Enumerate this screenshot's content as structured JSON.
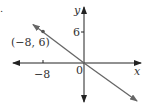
{
  "figure": {
    "corner_mark": ".",
    "axes": {
      "x_label": "x",
      "y_label": "y",
      "origin_label": "0",
      "x_ticks": [
        {
          "value": -8,
          "label": "−8"
        }
      ],
      "y_ticks": [
        {
          "value": 6,
          "label": "6"
        }
      ]
    },
    "point": {
      "x": -8,
      "y": 6,
      "label": "(−8, 6)"
    },
    "line": {
      "description": "line through origin and (-8, 6)",
      "slope": -0.75,
      "intercept": 0
    },
    "colors": {
      "axis": "#222222",
      "line": "#666666",
      "text": "#333333"
    }
  }
}
